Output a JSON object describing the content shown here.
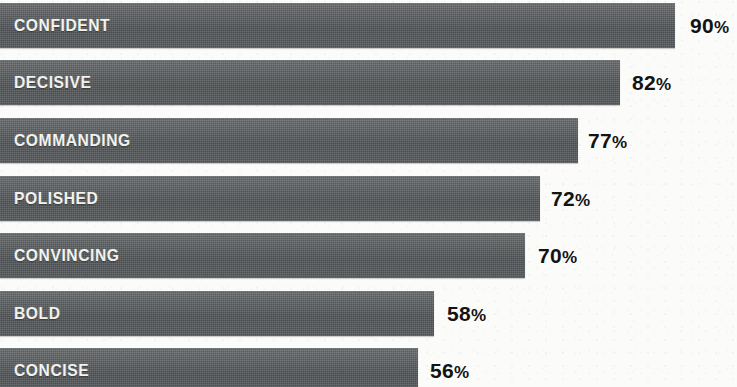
{
  "chart_data": {
    "type": "bar",
    "orientation": "horizontal",
    "title": "",
    "subtitle": "",
    "xlabel": "",
    "ylabel": "",
    "xlim": [
      0,
      100
    ],
    "grid": false,
    "legend": null,
    "value_suffix": "%",
    "categories": [
      "CONFIDENT",
      "DECISIVE",
      "COMMANDING",
      "POLISHED",
      "CONVINCING",
      "BOLD",
      "CONCISE"
    ],
    "values": [
      90,
      82,
      77,
      72,
      70,
      58,
      56
    ],
    "value_labels": [
      "90%",
      "82%",
      "77%",
      "72%",
      "70%",
      "58%",
      "56%"
    ],
    "bar_color": "#585c5e",
    "label_color": "#f2f2ee",
    "value_color": "#131313",
    "background_color": "#fbfbf9",
    "bars": [
      {
        "category": "CONFIDENT",
        "value": 90,
        "value_label": "90%",
        "value_number": "90",
        "percent_sign": "%"
      },
      {
        "category": "DECISIVE",
        "value": 82,
        "value_label": "82%",
        "value_number": "82",
        "percent_sign": "%"
      },
      {
        "category": "COMMANDING",
        "value": 77,
        "value_label": "77%",
        "value_number": "77",
        "percent_sign": "%"
      },
      {
        "category": "POLISHED",
        "value": 72,
        "value_label": "72%",
        "value_number": "72",
        "percent_sign": "%"
      },
      {
        "category": "CONVINCING",
        "value": 70,
        "value_label": "70%",
        "value_number": "70",
        "percent_sign": "%"
      },
      {
        "category": "BOLD",
        "value": 58,
        "value_label": "58%",
        "value_number": "58",
        "percent_sign": "%"
      },
      {
        "category": "CONCISE",
        "value": 56,
        "value_label": "56%",
        "value_number": "56",
        "percent_sign": "%"
      }
    ]
  },
  "layout": {
    "row_tops": [
      3,
      60,
      118,
      176,
      233,
      291,
      348
    ],
    "bar_widths": [
      675,
      620,
      578,
      540,
      525,
      434,
      418
    ],
    "value_lefts": [
      690,
      632,
      588,
      551,
      538,
      447,
      430
    ],
    "bar_height": 45
  }
}
